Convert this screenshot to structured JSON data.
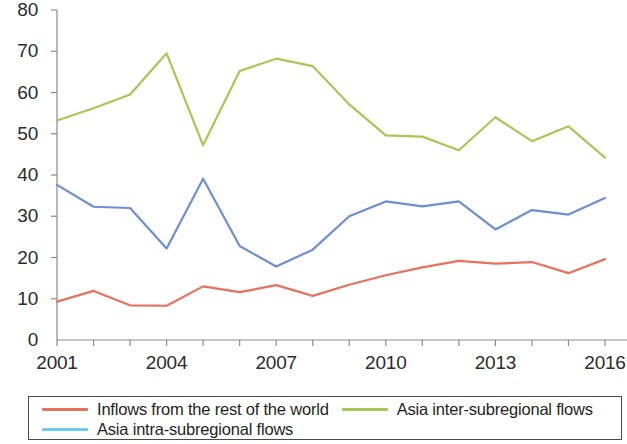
{
  "chart_data": {
    "type": "line",
    "title": "",
    "subtitle": "",
    "xlabel": "",
    "ylabel": "",
    "x": [
      2001,
      2002,
      2003,
      2004,
      2005,
      2006,
      2007,
      2008,
      2009,
      2010,
      2011,
      2012,
      2013,
      2014,
      2015,
      2016
    ],
    "xlim": [
      2001,
      2016
    ],
    "ylim": [
      0,
      80
    ],
    "xtick_labels": [
      "2001",
      "2004",
      "2007",
      "2010",
      "2013",
      "2016"
    ],
    "xtick_values": [
      2001,
      2004,
      2007,
      2010,
      2013,
      2016
    ],
    "ytick_labels": [
      "0",
      "10",
      "20",
      "30",
      "40",
      "50",
      "60",
      "70",
      "80"
    ],
    "ytick_values": [
      0,
      10,
      20,
      30,
      40,
      50,
      60,
      70,
      80
    ],
    "grid": false,
    "legend_position": "bottom",
    "series": [
      {
        "name": "Inflows from the rest of the world",
        "color": "#e8705d",
        "values": [
          9.3,
          11.9,
          8.4,
          8.3,
          13.0,
          11.6,
          13.3,
          10.7,
          13.4,
          15.7,
          17.6,
          19.2,
          18.5,
          18.9,
          16.2,
          19.6
        ]
      },
      {
        "name": "Asia inter-subregional flows",
        "color": "#a8c651",
        "values": [
          53.2,
          56.2,
          59.5,
          69.5,
          47.2,
          65.2,
          68.2,
          66.4,
          57.1,
          49.6,
          49.3,
          46.0,
          54.0,
          48.2,
          51.8,
          44.2
        ]
      },
      {
        "name": "Asia intra-subregional flows",
        "color": "#6d8ed4",
        "values": [
          37.6,
          32.3,
          32.0,
          22.2,
          39.1,
          22.8,
          17.8,
          21.9,
          30.0,
          33.6,
          32.4,
          33.6,
          26.8,
          31.5,
          30.4,
          34.4
        ]
      }
    ]
  },
  "legend": {
    "entries": [
      {
        "label": "Inflows from the rest of the world",
        "color": "#e8705d"
      },
      {
        "label": "Asia inter-subregional flows",
        "color": "#a8c651"
      },
      {
        "label": "Asia intra-subregional flows",
        "color": "#6ecbe8"
      }
    ]
  },
  "axis": {
    "color": "#8a8a8a"
  }
}
